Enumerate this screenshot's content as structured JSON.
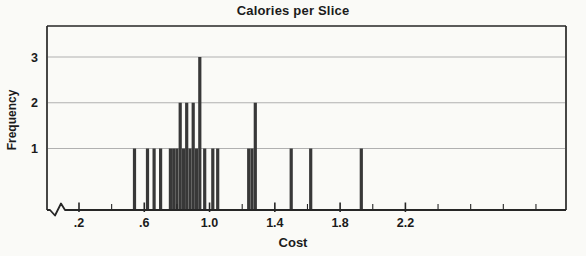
{
  "chart": {
    "title": "Calories per Slice",
    "xlabel": "Cost",
    "ylabel": "Frequency"
  },
  "chart_data": {
    "type": "bar",
    "subtype": "spike-histogram",
    "title": "Calories per Slice",
    "xlabel": "Cost",
    "ylabel": "Frequency",
    "grid": "horizontal-only",
    "legend": "none",
    "x_axis": {
      "min": 0.0,
      "max": 3.18,
      "break_near_origin": true,
      "tick_start": 0.2,
      "tick_end": 3.0,
      "tick_step": 0.2,
      "labeled_tick_values": [
        0.2,
        0.6,
        1.0,
        1.4,
        1.8,
        2.2
      ],
      "labeled_tick_labels": [
        ".2",
        ".6",
        "1.0",
        "1.4",
        "1.8",
        "2.2"
      ]
    },
    "y_axis": {
      "min": 0,
      "max": 3.7,
      "ticks": [
        1,
        2,
        3
      ],
      "tick_labels": [
        "1",
        "2",
        "3"
      ]
    },
    "points": [
      {
        "x": 0.54,
        "f": 1
      },
      {
        "x": 0.62,
        "f": 1
      },
      {
        "x": 0.66,
        "f": 1
      },
      {
        "x": 0.7,
        "f": 1
      },
      {
        "x": 0.76,
        "f": 1
      },
      {
        "x": 0.78,
        "f": 1
      },
      {
        "x": 0.8,
        "f": 1
      },
      {
        "x": 0.82,
        "f": 2
      },
      {
        "x": 0.84,
        "f": 1
      },
      {
        "x": 0.86,
        "f": 2
      },
      {
        "x": 0.88,
        "f": 1
      },
      {
        "x": 0.9,
        "f": 2
      },
      {
        "x": 0.92,
        "f": 1
      },
      {
        "x": 0.94,
        "f": 3
      },
      {
        "x": 0.97,
        "f": 1
      },
      {
        "x": 1.02,
        "f": 1
      },
      {
        "x": 1.05,
        "f": 1
      },
      {
        "x": 1.24,
        "f": 1
      },
      {
        "x": 1.26,
        "f": 1
      },
      {
        "x": 1.28,
        "f": 2
      },
      {
        "x": 1.5,
        "f": 1
      },
      {
        "x": 1.62,
        "f": 1
      },
      {
        "x": 1.93,
        "f": 1
      }
    ],
    "n_observations": 29,
    "colors": {
      "bar": "#383838",
      "gridline": "#b0b0b0",
      "frame": "#262626",
      "text": "#1b1b1b",
      "background": "#fafaf7"
    }
  }
}
